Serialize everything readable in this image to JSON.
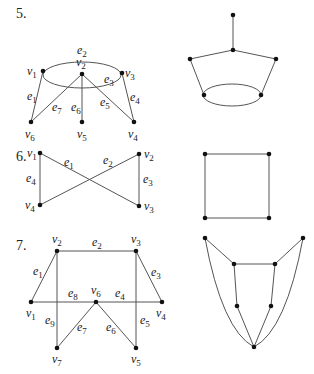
{
  "problems": [
    {
      "number": "5.",
      "left_graph": {
        "vertices": [
          {
            "id": "v1",
            "label": "v",
            "sub": "1",
            "x": 43,
            "y": 71,
            "lx": 27,
            "ly": 75
          },
          {
            "id": "v2",
            "label": "v",
            "sub": "2",
            "x": 82,
            "y": 74,
            "lx": 76,
            "ly": 66
          },
          {
            "id": "v3",
            "label": "v",
            "sub": "3",
            "x": 122,
            "y": 73,
            "lx": 125,
            "ly": 77
          },
          {
            "id": "v4",
            "label": "v",
            "sub": "4",
            "x": 134,
            "y": 122,
            "lx": 128,
            "ly": 138
          },
          {
            "id": "v5",
            "label": "v",
            "sub": "5",
            "x": 82,
            "y": 122,
            "lx": 77,
            "ly": 138
          },
          {
            "id": "v6",
            "label": "v",
            "sub": "6",
            "x": 31,
            "y": 122,
            "lx": 25,
            "ly": 138
          }
        ],
        "edges": [
          {
            "id": "e1",
            "type": "line",
            "from": "v1",
            "to": "v6",
            "label": "e",
            "sub": "1",
            "lx": 27,
            "ly": 100
          },
          {
            "id": "e2",
            "type": "arc-top",
            "label": "e",
            "sub": "2",
            "lx": 77,
            "ly": 54
          },
          {
            "id": "e3",
            "type": "arc-bottom",
            "label": "e",
            "sub": "3",
            "lx": 104,
            "ly": 83
          },
          {
            "id": "e4",
            "type": "line",
            "from": "v3",
            "to": "v4",
            "label": "e",
            "sub": "4",
            "lx": 130,
            "ly": 101
          },
          {
            "id": "e5",
            "type": "line",
            "from": "v2",
            "to": "v4",
            "label": "e",
            "sub": "5",
            "lx": 100,
            "ly": 106
          },
          {
            "id": "e6",
            "type": "line",
            "from": "v2",
            "to": "v5",
            "label": "e",
            "sub": "6",
            "lx": 71,
            "ly": 111
          },
          {
            "id": "e7",
            "type": "line",
            "from": "v2",
            "to": "v6",
            "label": "e",
            "sub": "7",
            "lx": 52,
            "ly": 111
          }
        ],
        "ellipse": {
          "cx": 82,
          "cy": 75,
          "rx": 39,
          "ry": 13
        }
      },
      "right_graph": {
        "vertices": [
          [
            233,
            15
          ],
          [
            233,
            50
          ],
          [
            190,
            59
          ],
          [
            276,
            59
          ],
          [
            204,
            95
          ],
          [
            261,
            95
          ]
        ],
        "edges": [
          [
            0,
            1
          ],
          [
            1,
            2
          ],
          [
            1,
            3
          ],
          [
            2,
            4
          ],
          [
            3,
            5
          ]
        ],
        "ellipse": {
          "cx": 232,
          "cy": 95,
          "rx": 29,
          "ry": 11
        }
      }
    },
    {
      "number": "6.",
      "left_graph": {
        "vertices": [
          {
            "id": "v1",
            "label": "v",
            "sub": "1",
            "x": 40,
            "y": 153,
            "lx": 27,
            "ly": 157
          },
          {
            "id": "v2",
            "label": "v",
            "sub": "2",
            "x": 139,
            "y": 154,
            "lx": 144,
            "ly": 158
          },
          {
            "id": "v3",
            "label": "v",
            "sub": "3",
            "x": 139,
            "y": 206,
            "lx": 144,
            "ly": 210
          },
          {
            "id": "v4",
            "label": "v",
            "sub": "4",
            "x": 40,
            "y": 205,
            "lx": 25,
            "ly": 209
          }
        ],
        "edges": [
          {
            "id": "e1",
            "from": "v1",
            "to": "v3",
            "label": "e",
            "sub": "1",
            "lx": 64,
            "ly": 166
          },
          {
            "id": "e2",
            "from": "v2",
            "to": "v4",
            "label": "e",
            "sub": "2",
            "lx": 103,
            "ly": 164
          },
          {
            "id": "e3",
            "from": "v2",
            "to": "v3",
            "label": "e",
            "sub": "3",
            "lx": 143,
            "ly": 183
          },
          {
            "id": "e4",
            "from": "v1",
            "to": "v4",
            "label": "e",
            "sub": "4",
            "lx": 26,
            "ly": 182
          }
        ]
      },
      "right_graph": {
        "vertices": [
          [
            205,
            154
          ],
          [
            269,
            154
          ],
          [
            269,
            218
          ],
          [
            205,
            218
          ]
        ],
        "edges": [
          [
            0,
            1
          ],
          [
            1,
            2
          ],
          [
            2,
            3
          ],
          [
            3,
            0
          ]
        ]
      }
    },
    {
      "number": "7.",
      "left_graph": {
        "vertices": [
          {
            "id": "v1",
            "label": "v",
            "sub": "1",
            "x": 31,
            "y": 302,
            "lx": 26,
            "ly": 317
          },
          {
            "id": "v2",
            "label": "v",
            "sub": "2",
            "x": 57,
            "y": 251,
            "lx": 52,
            "ly": 243
          },
          {
            "id": "v3",
            "label": "v",
            "sub": "3",
            "x": 136,
            "y": 251,
            "lx": 131,
            "ly": 243
          },
          {
            "id": "v4",
            "label": "v",
            "sub": "4",
            "x": 162,
            "y": 302,
            "lx": 156,
            "ly": 317
          },
          {
            "id": "v5",
            "label": "v",
            "sub": "5",
            "x": 136,
            "y": 348,
            "lx": 131,
            "ly": 363
          },
          {
            "id": "v6",
            "label": "v",
            "sub": "6",
            "x": 96,
            "y": 302,
            "lx": 91,
            "ly": 294
          },
          {
            "id": "v7",
            "label": "v",
            "sub": "7",
            "x": 57,
            "y": 348,
            "lx": 52,
            "ly": 363
          }
        ],
        "edges": [
          {
            "id": "e1",
            "from": "v1",
            "to": "v2",
            "label": "e",
            "sub": "1",
            "lx": 33,
            "ly": 275
          },
          {
            "id": "e2",
            "from": "v2",
            "to": "v3",
            "label": "e",
            "sub": "2",
            "lx": 92,
            "ly": 246
          },
          {
            "id": "e3",
            "from": "v3",
            "to": "v4",
            "label": "e",
            "sub": "3",
            "lx": 151,
            "ly": 276
          },
          {
            "id": "e4",
            "from": "v6",
            "to": "v4",
            "label": "e",
            "sub": "4",
            "lx": 115,
            "ly": 297
          },
          {
            "id": "e5",
            "from": "v3",
            "to": "v5",
            "label": "e",
            "sub": "5",
            "lx": 140,
            "ly": 324
          },
          {
            "id": "e6",
            "from": "v6",
            "to": "v5",
            "label": "e",
            "sub": "6",
            "lx": 106,
            "ly": 331
          },
          {
            "id": "e7",
            "from": "v6",
            "to": "v7",
            "label": "e",
            "sub": "7",
            "lx": 77,
            "ly": 331
          },
          {
            "id": "e8",
            "from": "v1",
            "to": "v6",
            "label": "e",
            "sub": "8",
            "lx": 68,
            "ly": 297
          },
          {
            "id": "e9",
            "from": "v2",
            "to": "v7",
            "label": "e",
            "sub": "9",
            "lx": 45,
            "ly": 324
          }
        ]
      },
      "right_graph": {
        "vertices": [
          [
            205,
            238
          ],
          [
            303,
            238
          ],
          [
            234,
            264
          ],
          [
            275,
            264
          ],
          [
            237,
            306
          ],
          [
            271,
            306
          ],
          [
            254,
            347
          ]
        ],
        "edges": [
          [
            0,
            2
          ],
          [
            1,
            3
          ],
          [
            2,
            3
          ],
          [
            2,
            4
          ],
          [
            3,
            5
          ],
          [
            4,
            6
          ],
          [
            5,
            6
          ]
        ],
        "curves": [
          {
            "d": "M205,238 Q222,330 254,347"
          },
          {
            "d": "M303,238 Q286,330 254,347"
          }
        ]
      }
    }
  ]
}
